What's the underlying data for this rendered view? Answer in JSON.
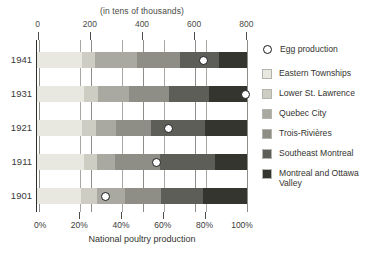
{
  "chart_data": {
    "type": "bar",
    "orientation": "horizontal",
    "stacked": true,
    "normalized": true,
    "title": "(in tens of thousands)",
    "xlabel": "National poultry production",
    "ylabel": "",
    "categories": [
      "1941",
      "1931",
      "1921",
      "1911",
      "1901"
    ],
    "top_axis": {
      "label": "(in tens of thousands)",
      "ticks": [
        0,
        200,
        400,
        600,
        800
      ],
      "tick_labels": [
        "0",
        "200",
        "400",
        "600",
        "800"
      ],
      "range": [
        0,
        800
      ]
    },
    "bottom_axis": {
      "label": "National poultry production",
      "ticks": [
        0,
        20,
        40,
        60,
        80,
        100
      ],
      "tick_labels": [
        "0%",
        "20%",
        "40%",
        "60%",
        "80%",
        "100%"
      ],
      "range": [
        0,
        100
      ]
    },
    "grid": true,
    "legend_position": "right",
    "series": [
      {
        "name": "Eastern Townships",
        "color": "#e8e8e0",
        "values": [
          21.5,
          22.5,
          21.5,
          22.5,
          21.0
        ]
      },
      {
        "name": "Lower St. Lawrence",
        "color": "#cdcdc3",
        "values": [
          6.0,
          6.5,
          6.5,
          6.0,
          7.5
        ]
      },
      {
        "name": "Quebec City",
        "color": "#a9a9a1",
        "values": [
          20.0,
          15.0,
          9.5,
          8.5,
          13.5
        ]
      },
      {
        "name": "Trois-Rivières",
        "color": "#8e8e86",
        "values": [
          20.5,
          19.0,
          17.0,
          21.5,
          17.0
        ]
      },
      {
        "name": "Southeast Montreal",
        "color": "#5e5e58",
        "values": [
          18.5,
          19.0,
          25.5,
          26.5,
          20.0
        ]
      },
      {
        "name": "Montreal and Ottawa Valley",
        "color": "#35352f",
        "values": [
          13.5,
          18.0,
          20.0,
          15.0,
          21.0
        ]
      }
    ],
    "egg_production": {
      "name": "Egg production",
      "marker": "diamond",
      "values_pct": [
        79.5,
        99.5,
        62.5,
        57.0,
        32.5
      ],
      "note": "Diamond markers positioned along the 0%-100% axis"
    }
  },
  "legend": {
    "egg_label": "Egg production",
    "items": [
      {
        "label": "Eastern Townships",
        "color": "#e8e8e0"
      },
      {
        "label": "Lower St. Lawrence",
        "color": "#cdcdc3"
      },
      {
        "label": "Quebec City",
        "color": "#a9a9a1"
      },
      {
        "label": "Trois-Rivières",
        "color": "#8e8e86"
      },
      {
        "label": "Southeast Montreal",
        "color": "#5e5e58"
      },
      {
        "label": "Montreal and Ottawa Valley",
        "color": "#35352f"
      }
    ]
  }
}
